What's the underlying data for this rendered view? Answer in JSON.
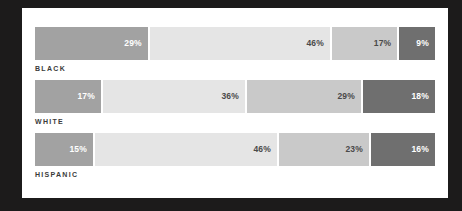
{
  "chart_data": {
    "type": "bar",
    "subtype": "stacked-horizontal-100-percent",
    "title": "",
    "subtitle": "",
    "xlabel": "",
    "ylabel": "",
    "xlim": [
      0,
      100
    ],
    "grid": false,
    "legend": "none",
    "categories": [
      "BLACK",
      "WHITE",
      "HISPANIC"
    ],
    "series": [
      {
        "name": "Segment 1",
        "color": "#a2a2a2",
        "values": [
          29,
          17,
          15
        ]
      },
      {
        "name": "Segment 2",
        "color": "#e5e5e5",
        "values": [
          46,
          36,
          46
        ]
      },
      {
        "name": "Segment 3",
        "color": "#c9c9c9",
        "values": [
          17,
          29,
          23
        ]
      },
      {
        "name": "Segment 4",
        "color": "#6f6f6f",
        "values": [
          9,
          18,
          16
        ]
      }
    ],
    "bars": [
      {
        "category": "BLACK",
        "segments": [
          {
            "value": 29,
            "label": "29%",
            "color": "#a2a2a2",
            "text_color": "#ffffff"
          },
          {
            "value": 46,
            "label": "46%",
            "color": "#e5e5e5",
            "text_color": "#4a4a4a"
          },
          {
            "value": 17,
            "label": "17%",
            "color": "#c9c9c9",
            "text_color": "#4a4a4a"
          },
          {
            "value": 9,
            "label": "9%",
            "color": "#6f6f6f",
            "text_color": "#ffffff"
          }
        ]
      },
      {
        "category": "WHITE",
        "segments": [
          {
            "value": 17,
            "label": "17%",
            "color": "#a2a2a2",
            "text_color": "#ffffff"
          },
          {
            "value": 36,
            "label": "36%",
            "color": "#e5e5e5",
            "text_color": "#4a4a4a"
          },
          {
            "value": 29,
            "label": "29%",
            "color": "#c9c9c9",
            "text_color": "#4a4a4a"
          },
          {
            "value": 18,
            "label": "18%",
            "color": "#6f6f6f",
            "text_color": "#ffffff"
          }
        ]
      },
      {
        "category": "HISPANIC",
        "segments": [
          {
            "value": 15,
            "label": "15%",
            "color": "#a2a2a2",
            "text_color": "#ffffff"
          },
          {
            "value": 46,
            "label": "46%",
            "color": "#e5e5e5",
            "text_color": "#4a4a4a"
          },
          {
            "value": 23,
            "label": "23%",
            "color": "#c9c9c9",
            "text_color": "#4a4a4a"
          },
          {
            "value": 16,
            "label": "16%",
            "color": "#6f6f6f",
            "text_color": "#ffffff"
          }
        ]
      }
    ]
  },
  "theme": {
    "background": "#1c1b1b",
    "card_background": "#ffffff",
    "label_color": "#3b3b3b"
  }
}
